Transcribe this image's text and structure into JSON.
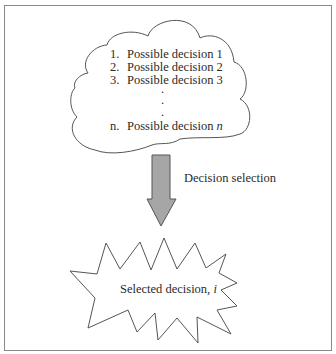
{
  "diagram": {
    "cloud": {
      "items": [
        {
          "number": "1.",
          "label": "Possible decision 1"
        },
        {
          "number": "2.",
          "label": "Possible decision 2"
        },
        {
          "number": "3.",
          "label": "Possible decision 3"
        },
        {
          "number": "n.",
          "label": "Possible decision ",
          "label_italic": "n"
        }
      ],
      "ellipsis": [
        ".",
        ".",
        "."
      ]
    },
    "arrow": {
      "label": "Decision selection",
      "fill_color": "#a6a6a6",
      "stroke_color": "#555555"
    },
    "result": {
      "label": "Selected decision, ",
      "label_italic": "i"
    },
    "colors": {
      "frame": "#8a8a8a",
      "line": "#555555",
      "text": "#2a2a2a",
      "background": "#ffffff"
    }
  }
}
